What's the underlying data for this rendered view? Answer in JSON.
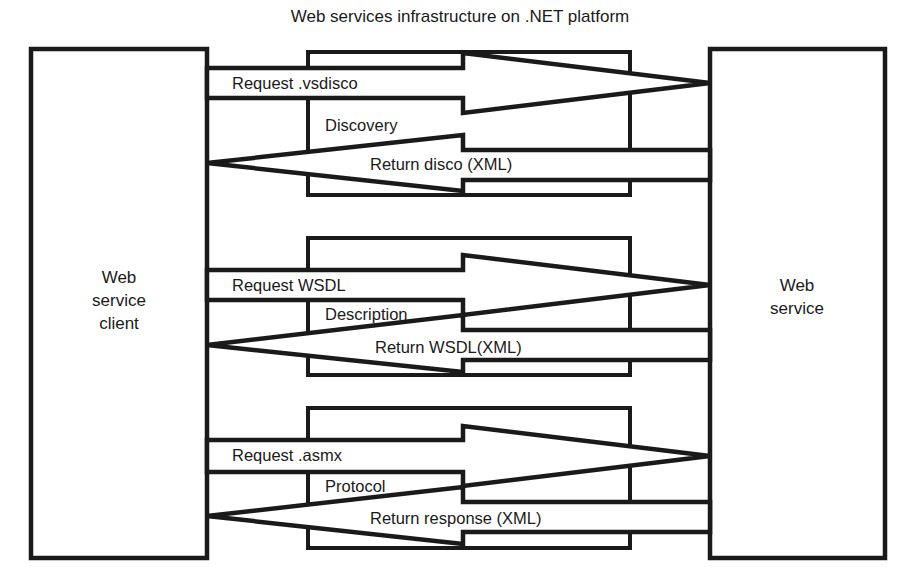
{
  "title": "Web services infrastructure on .NET platform",
  "nodes": {
    "client": {
      "name": "Web service client",
      "lines": [
        "Web",
        "service",
        "client"
      ]
    },
    "service": {
      "name": "Web service",
      "lines": [
        "Web",
        "service"
      ]
    }
  },
  "blocks": [
    {
      "stage": "Discovery",
      "request_label": "Request .vsdisco",
      "response_label": "Return disco (XML)"
    },
    {
      "stage": "Description",
      "request_label": "Request WSDL",
      "response_label": "Return WSDL(XML)"
    },
    {
      "stage": "Protocol",
      "request_label": "Request .asmx",
      "response_label": "Return response (XML)"
    }
  ],
  "colors": {
    "ink": "#1a1a1a",
    "paper": "#ffffff"
  }
}
